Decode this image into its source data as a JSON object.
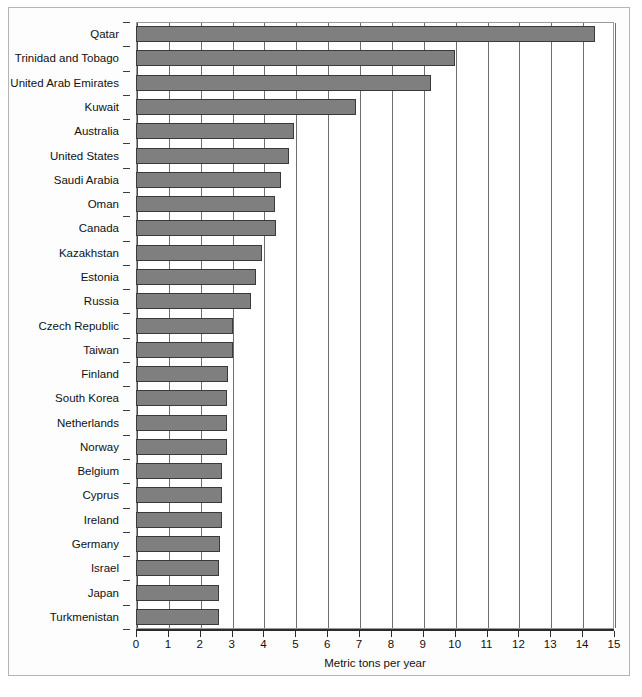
{
  "chart_data": {
    "type": "bar",
    "orientation": "horizontal",
    "title": "",
    "subtitle": "",
    "xlabel": "Metric tons per year",
    "ylabel": "",
    "xlim": [
      0,
      15
    ],
    "ylim": null,
    "grid": true,
    "legend": null,
    "xticks": [
      "0",
      "1",
      "2",
      "3",
      "4",
      "5",
      "6",
      "7",
      "8",
      "9",
      "10",
      "11",
      "12",
      "13",
      "14",
      "15"
    ],
    "bar_color": "#7f7f7f",
    "bar_edge_color": "#3a3a3a",
    "categories": [
      "Qatar",
      "Trinidad and Tobago",
      "United Arab Emirates",
      "Kuwait",
      "Australia",
      "United States",
      "Saudi Arabia",
      "Oman",
      "Canada",
      "Kazakhstan",
      "Estonia",
      "Russia",
      "Czech Republic",
      "Taiwan",
      "Finland",
      "South Korea",
      "Netherlands",
      "Norway",
      "Belgium",
      "Cyprus",
      "Ireland",
      "Germany",
      "Israel",
      "Japan",
      "Turkmenistan"
    ],
    "values": [
      14.4,
      10.0,
      9.25,
      6.9,
      4.95,
      4.8,
      4.55,
      4.35,
      4.4,
      3.95,
      3.75,
      3.6,
      3.05,
      3.05,
      2.9,
      2.85,
      2.85,
      2.85,
      2.7,
      2.7,
      2.7,
      2.65,
      2.6,
      2.6,
      2.6
    ]
  },
  "axis": {
    "x_title": "Metric tons per year"
  }
}
